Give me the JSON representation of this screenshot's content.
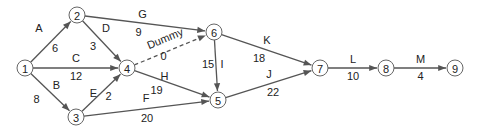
{
  "diagram": {
    "type": "activity-on-arrow network",
    "nodes": [
      {
        "id": "1",
        "label": "1",
        "x": 25,
        "y": 68
      },
      {
        "id": "2",
        "label": "2",
        "x": 77,
        "y": 15
      },
      {
        "id": "3",
        "label": "3",
        "x": 76,
        "y": 117
      },
      {
        "id": "4",
        "label": "4",
        "x": 127,
        "y": 68
      },
      {
        "id": "5",
        "label": "5",
        "x": 218,
        "y": 100
      },
      {
        "id": "6",
        "label": "6",
        "x": 214,
        "y": 32
      },
      {
        "id": "7",
        "label": "7",
        "x": 320,
        "y": 68
      },
      {
        "id": "8",
        "label": "8",
        "x": 386,
        "y": 68
      },
      {
        "id": "9",
        "label": "9",
        "x": 455,
        "y": 68
      }
    ],
    "edges": [
      {
        "from": "1",
        "to": "2",
        "activity": "A",
        "duration": "6"
      },
      {
        "from": "1",
        "to": "4",
        "activity": "C",
        "duration": "12"
      },
      {
        "from": "1",
        "to": "3",
        "activity": "B",
        "duration": "8"
      },
      {
        "from": "2",
        "to": "6",
        "activity": "G",
        "duration": "9"
      },
      {
        "from": "2",
        "to": "4",
        "activity": "D",
        "duration": "3"
      },
      {
        "from": "3",
        "to": "4",
        "activity": "E",
        "duration": "2"
      },
      {
        "from": "3",
        "to": "5",
        "activity": "F",
        "duration": "20"
      },
      {
        "from": "4",
        "to": "6",
        "activity": "Dummy",
        "duration": "0",
        "dashed": true
      },
      {
        "from": "4",
        "to": "5",
        "activity": "H",
        "duration": "19"
      },
      {
        "from": "6",
        "to": "5",
        "activity": "I",
        "duration": "15"
      },
      {
        "from": "6",
        "to": "7",
        "activity": "K",
        "duration": "18"
      },
      {
        "from": "5",
        "to": "7",
        "activity": "J",
        "duration": "22"
      },
      {
        "from": "7",
        "to": "8",
        "activity": "L",
        "duration": "10"
      },
      {
        "from": "8",
        "to": "9",
        "activity": "M",
        "duration": "4"
      }
    ]
  }
}
